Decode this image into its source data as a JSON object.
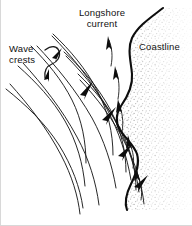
{
  "figure": {
    "background_color": "#ffffff",
    "ink_color": "#111111",
    "stipple_color": "#9a9a9a",
    "width": 192,
    "height": 226
  },
  "labels": {
    "longshore_line1": "Longshore",
    "longshore_line2": "current",
    "coastline": "Coastline",
    "wave_line1": "Wave",
    "wave_line2": "crests"
  },
  "diagram_data": {
    "type": "diagram",
    "subject": "coastal wave refraction",
    "elements": [
      {
        "name": "coastline",
        "kind": "heavy-curve",
        "description": "bold irregular shoreline running top-right to bottom-center with two seaward bulges",
        "stroke_width": 2.2
      },
      {
        "name": "land-stipple",
        "kind": "stipple-band",
        "description": "dotted sand texture band on the landward (right) side of the coastline",
        "band_width_px": 16
      },
      {
        "name": "wave-crests",
        "kind": "curve-family",
        "count": 6,
        "description": "parallel crest lines approaching from lower-left, refracting to become parallel to the shore"
      },
      {
        "name": "wave-orthogonals",
        "kind": "curve-family",
        "count": 6,
        "description": "rays perpendicular to the crests, bending shoreward"
      },
      {
        "name": "wave-direction-arrows",
        "kind": "arrowheads",
        "count": 4,
        "direction": "toward shore (up and to the right)"
      },
      {
        "name": "longshore-current-arrows",
        "kind": "arrowheads",
        "count": 5,
        "direction": "alongshore (upward / northward)"
      },
      {
        "name": "wave-crests-pointer",
        "kind": "curly-bracket-leader",
        "description": "hooked leader connecting the Wave crests label to the crest lines"
      }
    ]
  }
}
